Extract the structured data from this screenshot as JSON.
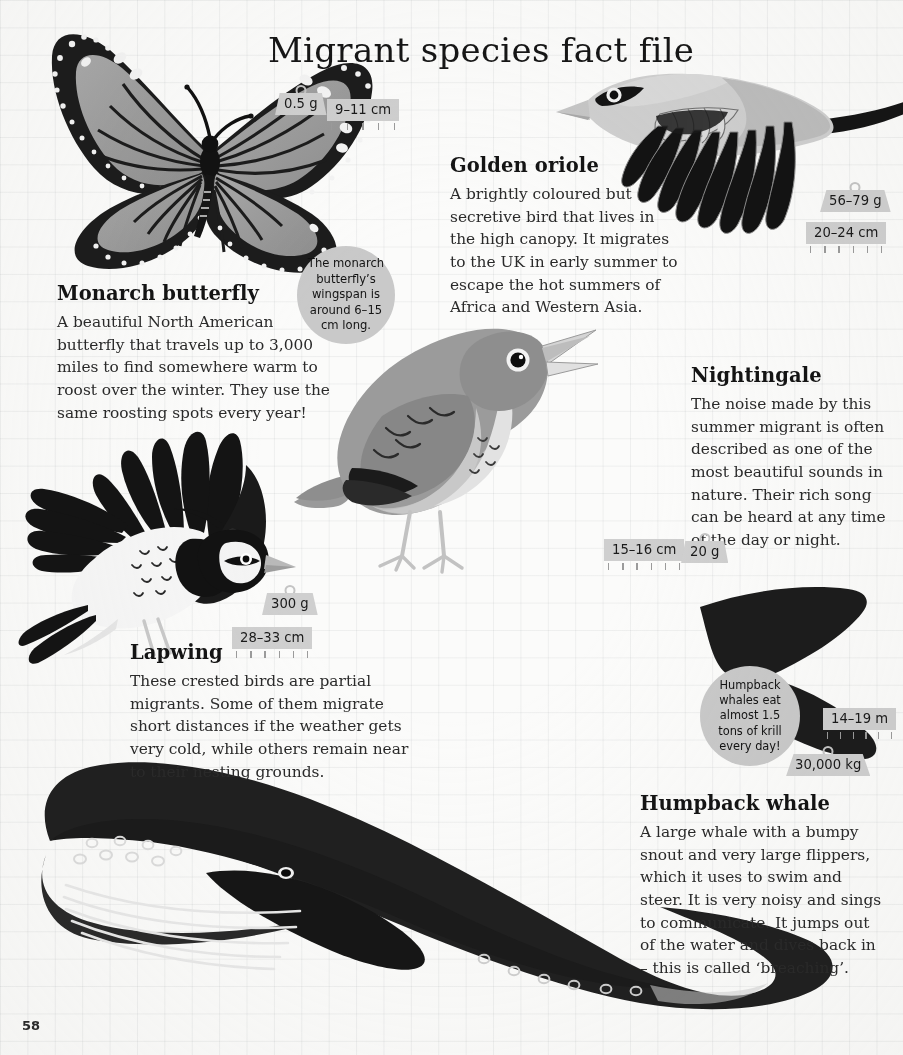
{
  "page": {
    "title": "Migrant species fact file",
    "folio": "58",
    "paper_color": "#fbfbfa",
    "grid_color": "#96999f",
    "ink_color": "#1d1d1d",
    "tag_color": "#cfcfcf",
    "bubble_color": "#c9c9c9"
  },
  "species": [
    {
      "id": "monarch-butterfly",
      "name": "Monarch butterfly",
      "description": "A beautiful North American butterfly that travels up to 3,000 miles to find somewhere warm to roost over the winter. They use the same roosting spots every year!",
      "weight": "0.5 g",
      "length": "9–11 cm",
      "fact": "The monarch butterfly’s wingspan is around 6–15 cm long."
    },
    {
      "id": "golden-oriole",
      "name": "Golden oriole",
      "description": "A brightly coloured but secretive bird that lives in the high canopy. It migrates to the UK in early summer to escape the hot summers of Africa and Western Asia.",
      "weight": "56–79 g",
      "length": "20–24 cm",
      "fact": null
    },
    {
      "id": "nightingale",
      "name": "Nightingale",
      "description": "The noise made by this summer migrant is often described as one of the most beautiful sounds in nature. Their rich song can be heard at any time of the day or night.",
      "weight": "20 g",
      "length": "15–16 cm",
      "fact": null
    },
    {
      "id": "lapwing",
      "name": "Lapwing",
      "description": "These crested birds are partial migrants. Some of them migrate short distances if the weather gets very cold, while others remain near to their nesting grounds.",
      "weight": "300 g",
      "length": "28–33 cm",
      "fact": null
    },
    {
      "id": "humpback-whale",
      "name": "Humpback whale",
      "description": "A large whale with a bumpy snout and very large flippers, which it uses to swim and steer. It is very noisy and sings to communicate. It jumps out of the water and dives back in – this is called ‘breaching’.",
      "weight": "30,000 kg",
      "length": "14–19 m",
      "fact": "Humpback whales eat almost 1.5 tons of krill every day!"
    }
  ]
}
